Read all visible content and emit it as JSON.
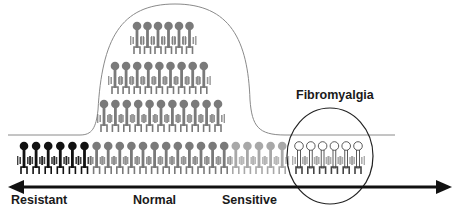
{
  "labels": {
    "resistant": "Resistant",
    "normal": "Normal",
    "sensitive": "Sensitive",
    "fibromyalgia": "Fibromyalgia"
  },
  "colors": {
    "resistant": "#111111",
    "normal": "#7a7a7a",
    "sensitive": "#a8a8a8",
    "fibromyalgia": "#ffffff",
    "outline": "#555555",
    "arrow": "#111111"
  },
  "rows": {
    "row1_count": 6,
    "row2_count": 9,
    "row3_count": 11,
    "bottom": {
      "resistant_count": 6,
      "normal_count": 12,
      "sensitive_count": 5,
      "fibromyalgia_count": 6
    }
  }
}
